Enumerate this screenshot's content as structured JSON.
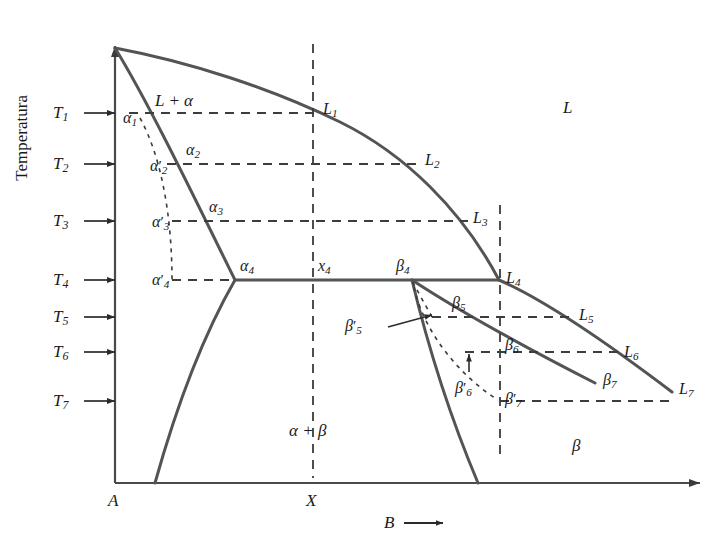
{
  "figure": {
    "kind": "binary-eutectic-phase-diagram",
    "background_color": "#ffffff",
    "line_color": "#545454",
    "text_color": "#1a1a1a",
    "axis_color": "#4a4a4a"
  },
  "axes": {
    "y_label": "Temperatura",
    "x_label": "B",
    "x_label_arrow": "⟶",
    "x_origin_label": "A",
    "x_mid_label": "X"
  },
  "temperature_ticks": [
    {
      "id": "T1",
      "base": "T",
      "sub": "1",
      "y": 113
    },
    {
      "id": "T2",
      "base": "T",
      "sub": "2",
      "y": 164
    },
    {
      "id": "T3",
      "base": "T",
      "sub": "3",
      "y": 221
    },
    {
      "id": "T4",
      "base": "T",
      "sub": "4",
      "y": 280
    },
    {
      "id": "T5",
      "base": "T",
      "sub": "5",
      "y": 317
    },
    {
      "id": "T6",
      "base": "T",
      "sub": "6",
      "y": 352
    },
    {
      "id": "T7",
      "base": "T",
      "sub": "7",
      "y": 401
    }
  ],
  "region_labels": [
    {
      "id": "liquid",
      "text": "L",
      "x": 563,
      "y": 99,
      "kind": "region"
    },
    {
      "id": "liquid-alpha",
      "text": "L + α",
      "x": 155,
      "y": 92,
      "kind": "region"
    },
    {
      "id": "alpha-beta",
      "text": "α + β",
      "x": 289,
      "y": 422,
      "kind": "region"
    },
    {
      "id": "beta",
      "text": "β",
      "x": 572,
      "y": 437,
      "kind": "region"
    }
  ],
  "alpha_points": [
    {
      "id": "a1",
      "base": "α",
      "prime": false,
      "sub": "1",
      "x": 123,
      "y": 110
    },
    {
      "id": "a2",
      "base": "α",
      "prime": false,
      "sub": "2",
      "x": 186,
      "y": 142
    },
    {
      "id": "a3",
      "base": "α",
      "prime": false,
      "sub": "3",
      "x": 209,
      "y": 199
    },
    {
      "id": "a4",
      "base": "α",
      "prime": false,
      "sub": "4",
      "x": 240,
      "y": 258
    },
    {
      "id": "a2p",
      "base": "α",
      "prime": true,
      "sub": "2",
      "x": 150,
      "y": 158
    },
    {
      "id": "a3p",
      "base": "α",
      "prime": true,
      "sub": "3",
      "x": 152,
      "y": 214
    },
    {
      "id": "a4p",
      "base": "α",
      "prime": true,
      "sub": "4",
      "x": 152,
      "y": 272
    }
  ],
  "liquid_points": [
    {
      "id": "L1",
      "base": "L",
      "prime": false,
      "sub": "1",
      "x": 323,
      "y": 101
    },
    {
      "id": "L2",
      "base": "L",
      "prime": false,
      "sub": "2",
      "x": 425,
      "y": 152
    },
    {
      "id": "L3",
      "base": "L",
      "prime": false,
      "sub": "3",
      "x": 473,
      "y": 210
    },
    {
      "id": "L4",
      "base": "L",
      "prime": false,
      "sub": "4",
      "x": 506,
      "y": 270
    },
    {
      "id": "L5",
      "base": "L",
      "prime": false,
      "sub": "5",
      "x": 579,
      "y": 307
    },
    {
      "id": "L6",
      "base": "L",
      "prime": false,
      "sub": "6",
      "x": 624,
      "y": 344
    },
    {
      "id": "L7",
      "base": "L",
      "prime": false,
      "sub": "7",
      "x": 679,
      "y": 381
    }
  ],
  "beta_points": [
    {
      "id": "b4",
      "base": "β",
      "prime": false,
      "sub": "4",
      "x": 396,
      "y": 258
    },
    {
      "id": "b5",
      "base": "β",
      "prime": false,
      "sub": "5",
      "x": 452,
      "y": 295
    },
    {
      "id": "b6",
      "base": "β",
      "prime": false,
      "sub": "6",
      "x": 505,
      "y": 337
    },
    {
      "id": "b7",
      "base": "β",
      "prime": false,
      "sub": "7",
      "x": 603,
      "y": 372
    },
    {
      "id": "b5p",
      "base": "β",
      "prime": true,
      "sub": "5",
      "x": 372,
      "y": 318
    },
    {
      "id": "b6p",
      "base": "β",
      "prime": true,
      "sub": "6",
      "x": 462,
      "y": 380
    },
    {
      "id": "b7p",
      "base": "β",
      "prime": true,
      "sub": "7",
      "x": 505,
      "y": 391
    }
  ],
  "composition_label": {
    "id": "x4",
    "base": "x",
    "sub": "4",
    "x": 318,
    "y": 258
  },
  "geometry": {
    "plot_left": 115,
    "plot_right": 712,
    "plot_top": 38,
    "plot_bottom": 483,
    "eutectic_y": 280,
    "x_line": 313,
    "right_dash_line": 500,
    "melting_point_A": {
      "x": 115,
      "y": 48
    },
    "alpha_solidus_end": {
      "x": 235,
      "y": 280
    },
    "beta_solidus_start": {
      "x": 412,
      "y": 280
    },
    "eutectic_point": {
      "x": 499,
      "y": 280
    }
  }
}
